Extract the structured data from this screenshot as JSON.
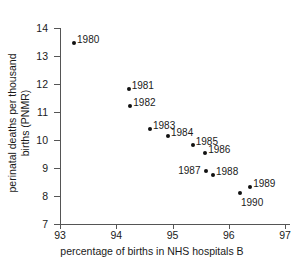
{
  "chart_data": {
    "type": "scatter",
    "title": "",
    "xlabel": "percentage of births in NHS hospitals B",
    "ylabel_lines": [
      "perinatal deaths per thousand",
      "births (PNMR)"
    ],
    "xlim": [
      93,
      97
    ],
    "ylim": [
      7,
      14
    ],
    "xticks": [
      "93",
      "94",
      "95",
      "96",
      "97"
    ],
    "yticks": [
      "14",
      "13",
      "12",
      "11",
      "10",
      "9",
      "8",
      "7"
    ],
    "grid": false,
    "legend": "none",
    "marker_color": "#111111",
    "axis_color": "#555555",
    "points": [
      {
        "label": "1980",
        "x": 93.25,
        "y": 13.45,
        "label_side": "right"
      },
      {
        "label": "1981",
        "x": 94.22,
        "y": 11.82,
        "label_side": "right"
      },
      {
        "label": "1982",
        "x": 94.25,
        "y": 11.22,
        "label_side": "right"
      },
      {
        "label": "1983",
        "x": 94.6,
        "y": 10.4,
        "label_side": "right"
      },
      {
        "label": "1984",
        "x": 94.92,
        "y": 10.15,
        "label_side": "right"
      },
      {
        "label": "1985",
        "x": 95.36,
        "y": 9.82,
        "label_side": "right"
      },
      {
        "label": "1986",
        "x": 95.58,
        "y": 9.53,
        "label_side": "right"
      },
      {
        "label": "1987",
        "x": 95.6,
        "y": 8.9,
        "label_side": "left"
      },
      {
        "label": "1988",
        "x": 95.72,
        "y": 8.74,
        "label_side": "right"
      },
      {
        "label": "1989",
        "x": 96.38,
        "y": 8.33,
        "label_side": "right"
      },
      {
        "label": "1990",
        "x": 96.2,
        "y": 8.1,
        "label_side": "below"
      }
    ]
  }
}
